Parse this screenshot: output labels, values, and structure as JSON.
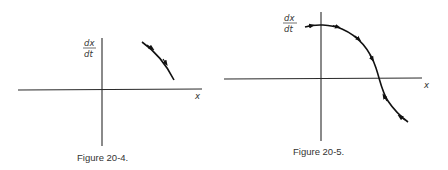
{
  "figures": [
    {
      "caption": "Figure 20-4.",
      "y_label_num": "dx",
      "y_label_den": "dt",
      "x_label": "x",
      "description": "Phase plot of dx/dt vs x: decreasing curve segment in first quadrant, arrows pointing down-right"
    },
    {
      "caption": "Figure 20-5.",
      "y_label_num": "dx",
      "y_label_den": "dt",
      "x_label": "x",
      "description": "Phase plot of dx/dt vs x: S-shaped decreasing curve crossing x-axis; arrows above axis point right, arrows below point back up-left toward the crossing (stable equilibrium)"
    }
  ],
  "colors": {
    "background": "#ffffff",
    "ink": "#111111"
  }
}
